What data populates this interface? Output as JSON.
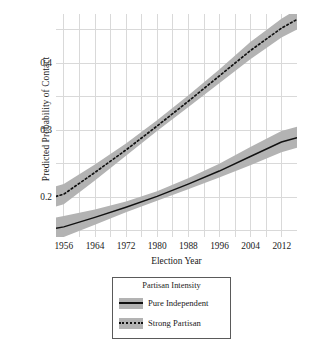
{
  "chart_data": {
    "type": "line",
    "title": "",
    "xlabel": "Election Year",
    "ylabel": "Predicted Probability of Contact",
    "xlim": [
      1954,
      2016
    ],
    "ylim": [
      0.155,
      0.4625
    ],
    "grid": true,
    "x_ticks": [
      1956,
      1964,
      1972,
      1980,
      1988,
      1996,
      2004,
      2012
    ],
    "x_minor_ticks": [
      1960,
      1968,
      1976,
      1984,
      1992,
      2000,
      2008,
      2016
    ],
    "y_ticks": [
      0.2,
      0.3,
      0.4
    ],
    "y_tick_labels": [
      "0.2",
      "0.3",
      "0.4"
    ],
    "legend": {
      "title": "Partisan Intensity",
      "position": "below-plot",
      "entries": [
        {
          "label": "Pure Independent",
          "style": "solid",
          "band_color": "#b3b3b3",
          "line_color": "#111111"
        },
        {
          "label": "Strong Partisan",
          "style": "dotted",
          "band_color": "#b3b3b3",
          "line_color": "#111111"
        }
      ]
    },
    "x": [
      1954,
      1956,
      1964,
      1972,
      1980,
      1988,
      1996,
      2004,
      2012,
      2016
    ],
    "series": [
      {
        "name": "Pure Independent",
        "style": "solid",
        "values": [
          0.167,
          0.169,
          0.182,
          0.196,
          0.211,
          0.228,
          0.246,
          0.266,
          0.286,
          0.292
        ],
        "ci_lower": [
          0.152,
          0.155,
          0.172,
          0.189,
          0.205,
          0.221,
          0.237,
          0.254,
          0.272,
          0.278
        ],
        "ci_upper": [
          0.182,
          0.184,
          0.193,
          0.204,
          0.218,
          0.236,
          0.256,
          0.279,
          0.301,
          0.307
        ]
      },
      {
        "name": "Strong Partisan",
        "style": "dotted",
        "values": [
          0.211,
          0.214,
          0.244,
          0.275,
          0.308,
          0.342,
          0.377,
          0.412,
          0.443,
          0.455
        ],
        "ci_lower": [
          0.197,
          0.2,
          0.233,
          0.267,
          0.301,
          0.334,
          0.367,
          0.4,
          0.43,
          0.441
        ],
        "ci_upper": [
          0.225,
          0.228,
          0.255,
          0.284,
          0.316,
          0.35,
          0.386,
          0.424,
          0.456,
          0.469
        ]
      }
    ]
  },
  "axes": {
    "y_title": "Predicted Probability of Contact",
    "x_title": "Election Year",
    "y_tick_labels": [
      "0.4",
      "0.3",
      "0.2"
    ],
    "x_tick_labels": [
      "1956",
      "1964",
      "1972",
      "1980",
      "1988",
      "1996",
      "2004",
      "2012"
    ]
  },
  "legend": {
    "title": "Partisan Intensity",
    "items": [
      {
        "label": "Pure Independent"
      },
      {
        "label": "Strong Partisan"
      }
    ]
  },
  "colors": {
    "band": "#b3b3b3",
    "line": "#111111",
    "grid": "#d9d9d9",
    "text": "#1a1a1a",
    "legend_border": "#5a5a5a"
  }
}
